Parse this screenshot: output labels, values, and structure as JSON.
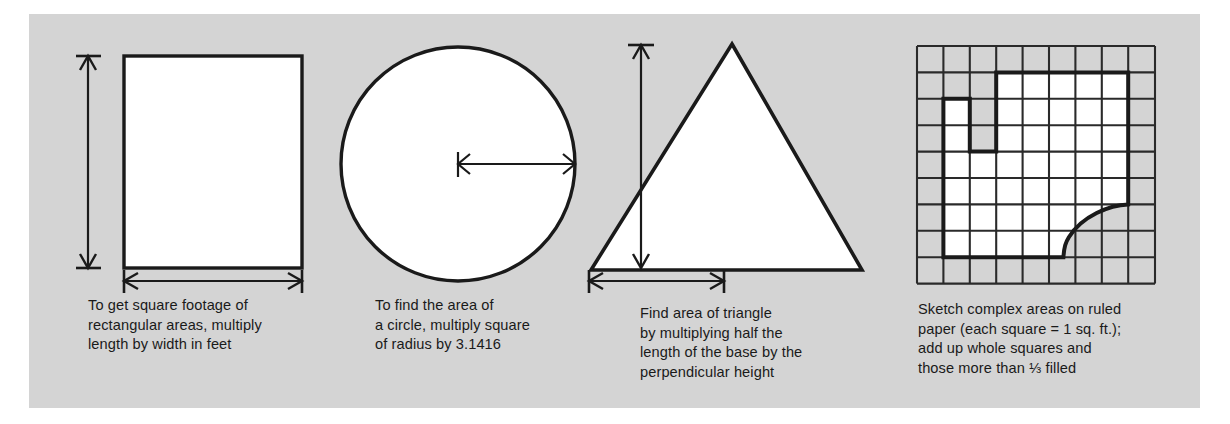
{
  "figure": {
    "name": "area-calculation-reference-figure",
    "panel_color": "#d4d4d4",
    "page_color": "#ffffff",
    "ink_color": "#1a1a1a",
    "shape_fill": "#ffffff"
  },
  "panels": [
    {
      "id": "rectangle",
      "shape": "rectangle",
      "dimension_labels": [
        "height-arrow",
        "width-arrow"
      ],
      "caption": "To get square footage of\nrectangular areas, multiply\nlength by width in feet"
    },
    {
      "id": "circle",
      "shape": "circle",
      "dimension_labels": [
        "radius-arrow"
      ],
      "caption": "To find the area of\na circle, multiply square\nof radius by  3.1416"
    },
    {
      "id": "triangle",
      "shape": "triangle",
      "dimension_labels": [
        "height-arrow",
        "half-base-arrow"
      ],
      "caption": "Find area of triangle\nby multiplying half the\nlength of the base by the\nperpendicular height"
    },
    {
      "id": "grid",
      "shape": "irregular-on-grid",
      "grid_columns": 9,
      "grid_rows": 9,
      "caption": "Sketch complex areas on ruled\npaper (each square = 1 sq. ft.);\nadd up whole squares and\nthose more than ⅓ filled"
    }
  ]
}
